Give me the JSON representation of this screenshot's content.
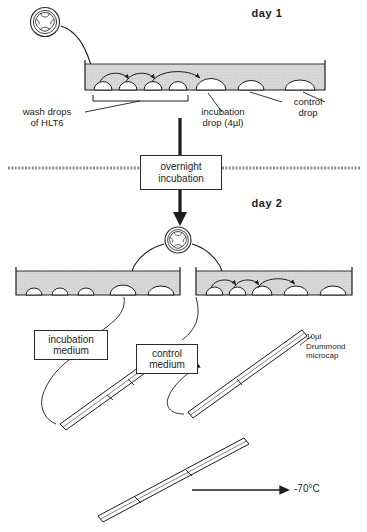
{
  "figure": {
    "type": "scientific-protocol-diagram",
    "background_color": "#ffffff",
    "ink_color": "#1d1d1d",
    "medium_fill_color": "#d6d6d6"
  },
  "day1": {
    "heading": "day 1",
    "dish": {
      "wash_drops_count": 4,
      "incubation_drops_count": 1,
      "control_drops_count": 1,
      "transfer_arrows": 3
    },
    "labels": {
      "wash_drops": "wash drops\nof HLT6",
      "incubation_drop": "incubation\ndrop (4µl)",
      "control_drop": "control\ndrop"
    }
  },
  "incubation_step": {
    "box_text": "overnight\nincubation"
  },
  "day2": {
    "heading": "day 2",
    "left_dish": {
      "drops_count": 5,
      "transfer_arrows": 0
    },
    "right_dish": {
      "drops_count": 5,
      "transfer_arrows": 3
    },
    "labels": {
      "incubation_medium": "incubation\nmedium",
      "control_medium": "control\nmedium",
      "microcap": "10µl\nDrummond\nmicrocap"
    }
  },
  "storage": {
    "temperature_label": "-70°C"
  },
  "icons": {
    "embryo": "embryo-icon",
    "pipette": "microcap-pipette-icon",
    "arrow": "arrow-icon"
  },
  "caption": {
    "text": ""
  }
}
